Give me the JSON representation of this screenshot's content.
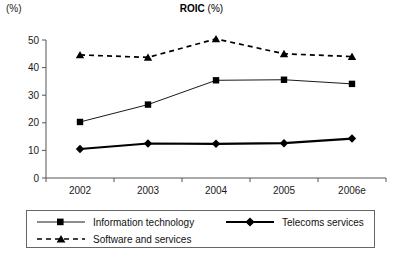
{
  "chart_data": {
    "type": "line",
    "title": "ROIC (%)",
    "title_main": "ROIC",
    "title_sub": " (%)",
    "ylabel": "(%)",
    "xlabel": "",
    "categories": [
      "2002",
      "2003",
      "2004",
      "2005",
      "2006e"
    ],
    "yticks": [
      0,
      10,
      20,
      30,
      40,
      50
    ],
    "ylim": [
      0,
      50
    ],
    "grid": false,
    "legend_position": "bottom",
    "series": [
      {
        "name": "Information technology",
        "marker": "square",
        "line_style": "solid-thin",
        "color": "#000000",
        "values": [
          20.3,
          26.6,
          35.4,
          35.6,
          34.1
        ]
      },
      {
        "name": "Telecoms services",
        "marker": "diamond",
        "line_style": "solid-thick",
        "color": "#000000",
        "values": [
          10.5,
          12.5,
          12.4,
          12.6,
          14.3
        ]
      },
      {
        "name": "Software and services",
        "marker": "triangle",
        "line_style": "dashed",
        "color": "#000000",
        "values": [
          44.6,
          43.7,
          50.4,
          45.0,
          44.0
        ]
      }
    ]
  },
  "legend": {
    "items": [
      {
        "label": "Information technology",
        "marker": "square",
        "style": "solid-thin"
      },
      {
        "label": "Telecoms services",
        "marker": "diamond",
        "style": "solid-thick"
      },
      {
        "label": "Software and services",
        "marker": "triangle",
        "style": "dashed"
      }
    ]
  },
  "axis": {
    "y_unit": "(%)"
  }
}
